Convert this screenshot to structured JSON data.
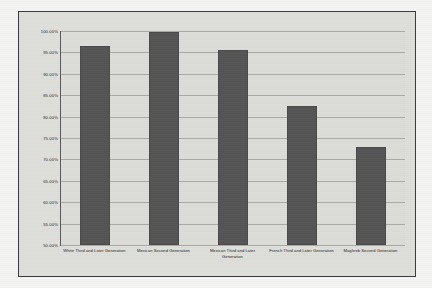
{
  "chart_data": {
    "type": "bar",
    "title": "Figure 3. Percent  with no PSE who are Employed  by Group in the United States and France (2000/2001).",
    "title_lines": [
      "Figure 3. Percent  with no PSE who are Employed  by Group in the",
      "United States and France (2000/2001)."
    ],
    "xlabel": "",
    "ylabel": "",
    "ylim": [
      50,
      100
    ],
    "ytick_step": 5,
    "grid": true,
    "legend": "none",
    "bar_color": "#555555",
    "plot_background": "#dcdcd8",
    "categories": [
      "White Third and Later Generation",
      "Mexican Second Generation",
      "Mexican Third and Later Generation",
      "French Third and Later Generation",
      "Maghreb Second Generation"
    ],
    "values": [
      96.5,
      99.8,
      95.5,
      82.5,
      73.0
    ],
    "ytick_labels": [
      "100.00%",
      "95.00%",
      "90.00%",
      "85.00%",
      "80.00%",
      "75.00%",
      "70.00%",
      "65.00%",
      "60.00%",
      "55.00%",
      "50.00%"
    ],
    "ytick_values": [
      100,
      95,
      90,
      85,
      80,
      75,
      70,
      65,
      60,
      55,
      50
    ]
  }
}
